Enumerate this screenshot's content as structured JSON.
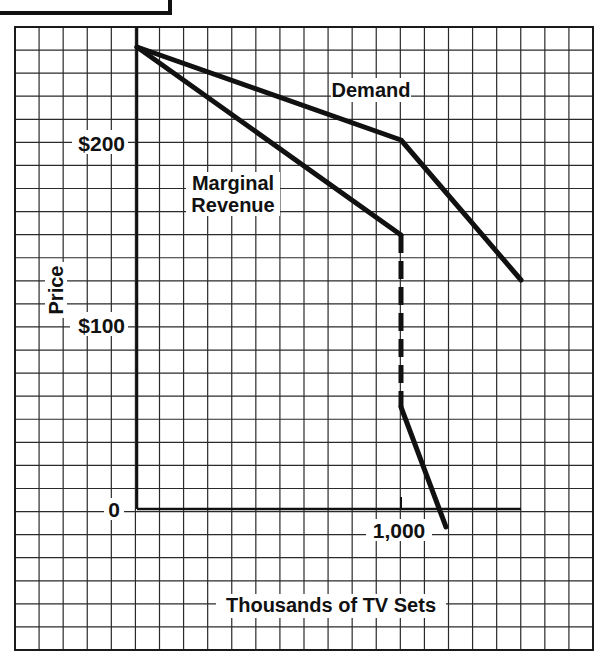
{
  "figure": {
    "colors": {
      "background": "#ffffff",
      "grid": "#2a2a2a",
      "curve": "#111111",
      "text": "#111111"
    }
  },
  "chart_data": {
    "type": "line",
    "title": "",
    "xlabel": "Thousands of TV Sets",
    "ylabel": "Price",
    "x_tick_labels": [
      {
        "value": 1000,
        "label": "1,000"
      }
    ],
    "y_tick_labels": [
      {
        "value": 0,
        "label": "0"
      },
      {
        "value": 100,
        "label": "$100"
      },
      {
        "value": 200,
        "label": "$200"
      }
    ],
    "xlim": [
      0,
      1455
    ],
    "ylim": [
      -10,
      250
    ],
    "grid": true,
    "legend": null,
    "annotations": [
      {
        "text": "Demand",
        "near_series": "Demand"
      },
      {
        "text": "Marginal",
        "near_series": "Marginal Revenue"
      },
      {
        "text": "Revenue",
        "near_series": "Marginal Revenue"
      }
    ],
    "series": [
      {
        "name": "Demand",
        "style": "solid",
        "points": [
          [
            0,
            250
          ],
          [
            1000,
            200
          ],
          [
            1455,
            124
          ]
        ]
      },
      {
        "name": "Marginal Revenue",
        "style": "solid",
        "points": [
          [
            0,
            250
          ],
          [
            1000,
            150
          ]
        ]
      },
      {
        "name": "Marginal Revenue gap",
        "style": "dashed",
        "points": [
          [
            1000,
            150
          ],
          [
            1000,
            55
          ]
        ]
      },
      {
        "name": "Marginal Revenue (lower)",
        "style": "solid",
        "points": [
          [
            1000,
            55
          ],
          [
            1170,
            -10
          ]
        ]
      }
    ]
  },
  "labels": {
    "ylabel": "Price",
    "xlabel": "Thousands of TV Sets",
    "y200": "$200",
    "y100": "$100",
    "y0": "0",
    "x1000": "1,000",
    "demand": "Demand",
    "mr_line1": "Marginal",
    "mr_line2": "Revenue"
  }
}
